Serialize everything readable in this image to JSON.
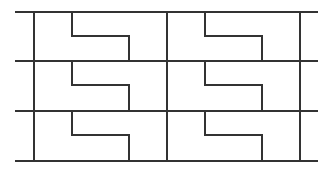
{
  "diagram": {
    "type": "grid-tiling",
    "stroke_color": "#333333",
    "background": "#ffffff",
    "horizontal_lines": [
      {
        "y": 12,
        "x1": 15,
        "x2": 318
      },
      {
        "y": 61,
        "x1": 15,
        "x2": 318
      },
      {
        "y": 111,
        "x1": 15,
        "x2": 318
      },
      {
        "y": 161,
        "x1": 15,
        "x2": 318
      }
    ],
    "vertical_lines": [
      {
        "x": 34,
        "y1": 12,
        "y2": 161
      },
      {
        "x": 167,
        "y1": 12,
        "y2": 161
      },
      {
        "x": 300,
        "y1": 12,
        "y2": 161
      }
    ],
    "step_offsets": {
      "left_x": 38,
      "right_x": 95,
      "mid_y": 24
    },
    "rows": [
      {
        "top": 12,
        "bottom": 61
      },
      {
        "top": 61,
        "bottom": 111
      },
      {
        "top": 111,
        "bottom": 161
      }
    ],
    "columns": [
      {
        "left": 34,
        "right": 167
      },
      {
        "left": 167,
        "right": 300
      }
    ]
  }
}
